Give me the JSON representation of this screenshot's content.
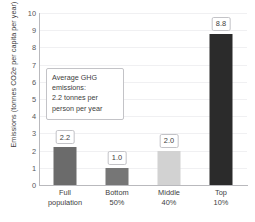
{
  "chart_data": {
    "type": "bar",
    "title": "",
    "xlabel": "",
    "ylabel": "Emissions (tonnes CO2e per capita per year)",
    "categories": [
      "Full population",
      "Bottom 50%",
      "Middle 40%",
      "Top 10%"
    ],
    "category_lines": [
      [
        "Full",
        "population"
      ],
      [
        "Bottom",
        "50%"
      ],
      [
        "Middle",
        "40%"
      ],
      [
        "Top",
        "10%"
      ]
    ],
    "values": [
      2.2,
      1.0,
      2.0,
      8.8
    ],
    "value_labels": [
      "2.2",
      "1.0",
      "2.0",
      "8.8"
    ],
    "bar_colors": [
      "#6b6b6b",
      "#767676",
      "#d2d2d2",
      "#2b2b2b"
    ],
    "ylim": [
      0,
      10
    ],
    "yticks": [
      0,
      1,
      2,
      3,
      4,
      5,
      6,
      7,
      8,
      9,
      10
    ],
    "ytick_labels": [
      "0",
      "1",
      "2",
      "3",
      "4",
      "5",
      "6",
      "7",
      "8",
      "9",
      "10"
    ],
    "grid": true,
    "grid_color": "#f0f0f2",
    "legend": "none",
    "annotations": [
      {
        "name": "average-ghg-emissions-note",
        "lines": [
          "Average GHG",
          "emissions:",
          "2.2 tonnes per",
          "person per year"
        ]
      }
    ]
  }
}
